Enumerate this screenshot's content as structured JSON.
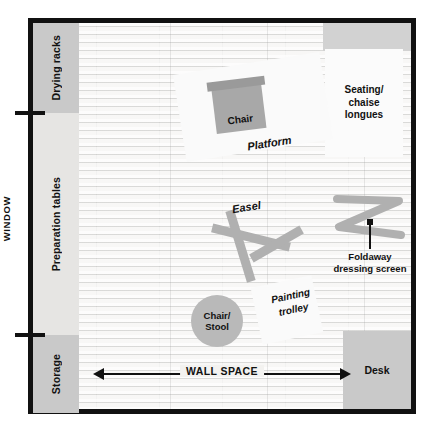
{
  "diagram": {
    "colors": {
      "wall": "#111111",
      "floor": "#efeeec",
      "furniture_grey": "#c9c9c9",
      "object_grey": "#b0b0b0",
      "white_object": "#fafafa"
    }
  },
  "window": {
    "label": "WINDOW"
  },
  "left_zones": [
    {
      "label": "Drying racks"
    },
    {
      "label": "Preparation tables"
    },
    {
      "label": "Storage"
    }
  ],
  "right_items": {
    "seating": "Seating/\nchaise\nlongues",
    "seating_lines": [
      "Seating/",
      "chaise",
      "longues"
    ],
    "desk": "Desk"
  },
  "objects": {
    "platform": "Platform",
    "chair": "Chair",
    "easel": "Easel",
    "stool_lines": [
      "Chair/",
      "Stool"
    ],
    "trolley_lines": [
      "Painting",
      "trolley"
    ],
    "screen_lines": [
      "Foldaway",
      "dressing screen"
    ]
  },
  "annotations": {
    "wall_space": "WALL SPACE"
  }
}
